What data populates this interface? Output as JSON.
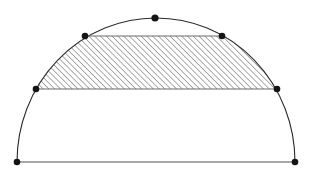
{
  "figure": {
    "canvas": {
      "width": 313,
      "height": 174,
      "background": "#ffffff"
    },
    "geometry": {
      "center": {
        "x": 156,
        "y": 162
      },
      "radius_x": 139,
      "radius_y": 144,
      "baseline_y": 162,
      "upper_chord_y": 36,
      "mid_chord_y": 89
    },
    "colors": {
      "arc_stroke": "#2b2b2b",
      "chord_stroke": "#6a6a6a",
      "baseline_stroke": "#8a8a8a",
      "vertex_fill": "#141414",
      "hatch_stroke": "#3c3c3c"
    },
    "strokes": {
      "arc_width": 1.1,
      "chord_width": 1.2,
      "baseline_width": 1.6,
      "hatch_width": 0.85,
      "hatch_spacing": 4.1,
      "hatch_angle_deg": 45
    },
    "vertices": [
      {
        "id": "baseline-left",
        "label": "A",
        "x": 17,
        "y": 162,
        "r": 3.3
      },
      {
        "id": "baseline-right",
        "label": "B",
        "x": 295,
        "y": 162,
        "r": 3.3
      },
      {
        "id": "mid-chord-left",
        "label": "C",
        "x": 36,
        "y": 89,
        "r": 3.3
      },
      {
        "id": "mid-chord-right",
        "label": "D",
        "x": 277,
        "y": 89,
        "r": 3.3
      },
      {
        "id": "upper-chord-left",
        "label": "E",
        "x": 85,
        "y": 36,
        "r": 3.3
      },
      {
        "id": "upper-chord-right",
        "label": "F",
        "x": 222,
        "y": 36,
        "r": 3.3
      },
      {
        "id": "arc-apex",
        "label": "G",
        "x": 155,
        "y": 18,
        "r": 3.6
      }
    ],
    "segments": [
      {
        "id": "baseline",
        "x1": 17,
        "y1": 162,
        "x2": 295,
        "y2": 162,
        "role": "diameter"
      },
      {
        "id": "mid-chord",
        "x1": 36,
        "y1": 89,
        "x2": 277,
        "y2": 89,
        "role": "lower-base-of-trapezoid"
      },
      {
        "id": "upper-chord",
        "x1": 85,
        "y1": 36,
        "x2": 222,
        "y2": 36,
        "role": "upper-base-of-trapezoid"
      }
    ],
    "shaded_region": {
      "id": "hatched-trapezoid",
      "fill_pattern": "diagonal-hatch",
      "top_y": 36,
      "bottom_y": 89,
      "top_left_x": 85,
      "top_right_x": 222,
      "bottom_left_x": 36,
      "bottom_right_x": 277
    }
  }
}
